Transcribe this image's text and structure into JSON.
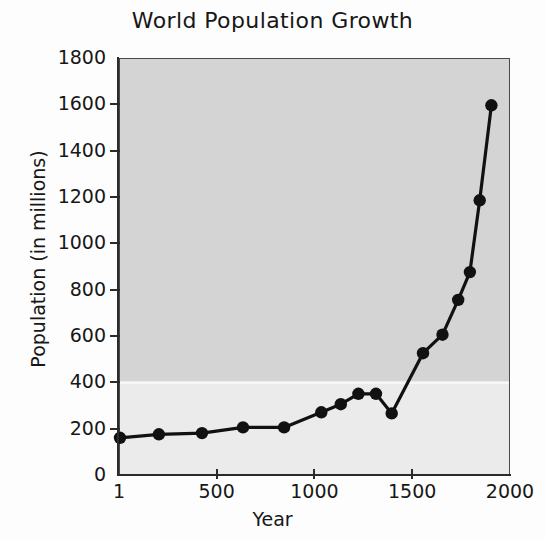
{
  "chart_data": {
    "type": "line",
    "title": "World Population Growth",
    "xlabel": "Year",
    "ylabel": "Population (in millions)",
    "xlim": [
      1,
      2000
    ],
    "ylim": [
      0,
      1800
    ],
    "xticks": [
      1,
      500,
      1000,
      1500,
      2000
    ],
    "xtick_labels": [
      "1",
      "500",
      "1000",
      "1500",
      "2000"
    ],
    "yticks": [
      0,
      200,
      400,
      600,
      800,
      1000,
      1200,
      1400,
      1600,
      1800
    ],
    "ytick_labels": [
      "0",
      "200",
      "400",
      "600",
      "800",
      "1000",
      "1200",
      "1400",
      "1600",
      "1800"
    ],
    "grid": "single white horizontal gridline at 400",
    "legend": "none",
    "marker": "filled-circle",
    "line_color": "#111111",
    "marker_color": "#111111",
    "plot_background": "#d4d4d4",
    "x": [
      1,
      200,
      420,
      630,
      840,
      1030,
      1130,
      1220,
      1310,
      1390,
      1550,
      1650,
      1730,
      1790,
      1840,
      1900
    ],
    "y": [
      165,
      180,
      185,
      210,
      210,
      275,
      310,
      355,
      355,
      270,
      530,
      610,
      760,
      880,
      1190,
      1600
    ],
    "points": [
      {
        "year": 1,
        "population": 165
      },
      {
        "year": 200,
        "population": 180
      },
      {
        "year": 420,
        "population": 185
      },
      {
        "year": 630,
        "population": 210
      },
      {
        "year": 840,
        "population": 210
      },
      {
        "year": 1030,
        "population": 275
      },
      {
        "year": 1130,
        "population": 310
      },
      {
        "year": 1220,
        "population": 355
      },
      {
        "year": 1310,
        "population": 355
      },
      {
        "year": 1390,
        "population": 270
      },
      {
        "year": 1550,
        "population": 530
      },
      {
        "year": 1650,
        "population": 610
      },
      {
        "year": 1730,
        "population": 760
      },
      {
        "year": 1790,
        "population": 880
      },
      {
        "year": 1840,
        "population": 1190
      },
      {
        "year": 1900,
        "population": 1600
      }
    ]
  }
}
